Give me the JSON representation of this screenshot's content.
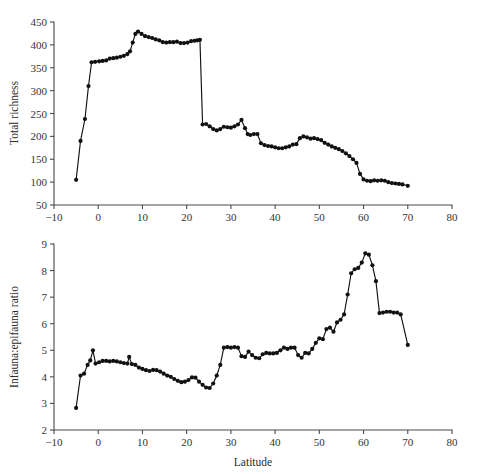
{
  "figure": {
    "background_color": "#ffffff",
    "line_color": "#111111",
    "axis_color": "#4a4a4a",
    "width": 482,
    "height": 474
  },
  "panels": [
    {
      "id": "top-panel",
      "ylabel": "Total richness",
      "xlabel": "",
      "plot": {
        "x": 54,
        "y": 22,
        "w": 398,
        "h": 183
      }
    },
    {
      "id": "bottom-panel",
      "ylabel": "Infauna:epifauna ratio",
      "xlabel": "Latitude",
      "plot": {
        "x": 54,
        "y": 244,
        "w": 398,
        "h": 186
      }
    }
  ],
  "chart_data": [
    {
      "type": "line",
      "title": "",
      "xlabel": "",
      "ylabel": "Total richness",
      "xlim": [
        -10,
        80
      ],
      "ylim": [
        50,
        450
      ],
      "xticks": [
        -10,
        0,
        10,
        20,
        30,
        40,
        50,
        60,
        70,
        80
      ],
      "yticks": [
        50,
        100,
        150,
        200,
        250,
        300,
        350,
        400,
        450
      ],
      "xtick_labels": [
        "−10",
        "0",
        "10",
        "20",
        "30",
        "40",
        "50",
        "60",
        "70",
        "80"
      ],
      "ytick_labels": [
        "50",
        "100",
        "150",
        "200",
        "250",
        "300",
        "350",
        "400",
        "450"
      ],
      "grid": false,
      "legend": null,
      "marker": "filled-circle",
      "x": [
        -5.0,
        -4.0,
        -3.0,
        -2.2,
        -1.5,
        -0.7,
        0.2,
        1.0,
        1.8,
        2.6,
        3.4,
        4.2,
        5.0,
        5.8,
        6.6,
        7.2,
        7.8,
        8.4,
        9.0,
        9.8,
        10.6,
        11.4,
        12.2,
        13.0,
        13.8,
        14.6,
        15.4,
        16.2,
        17.0,
        17.8,
        18.6,
        19.4,
        20.2,
        21.0,
        21.8,
        22.4,
        23.0,
        23.6,
        24.4,
        25.2,
        26.0,
        26.8,
        27.6,
        28.4,
        29.2,
        30.0,
        30.8,
        31.6,
        32.4,
        33.2,
        33.8,
        34.4,
        35.2,
        36.0,
        36.8,
        37.6,
        38.4,
        39.2,
        40.0,
        40.8,
        41.6,
        42.4,
        43.2,
        44.0,
        44.8,
        45.6,
        46.4,
        47.2,
        48.0,
        48.8,
        49.6,
        50.4,
        51.2,
        52.0,
        52.8,
        53.6,
        54.4,
        55.2,
        56.0,
        56.8,
        57.6,
        58.4,
        59.2,
        60.0,
        60.8,
        61.6,
        62.4,
        63.2,
        64.0,
        64.8,
        65.6,
        66.4,
        67.2,
        68.0,
        68.8,
        70.0
      ],
      "values": [
        105,
        190,
        238,
        310,
        362,
        363,
        364,
        365,
        366,
        370,
        371,
        372,
        374,
        376,
        380,
        386,
        405,
        424,
        429,
        424,
        419,
        417,
        415,
        412,
        410,
        406,
        405,
        406,
        406,
        407,
        404,
        404,
        405,
        408,
        409,
        410,
        411,
        226,
        227,
        222,
        216,
        213,
        216,
        221,
        220,
        219,
        222,
        226,
        236,
        218,
        205,
        203,
        205,
        205,
        185,
        181,
        179,
        178,
        176,
        174,
        174,
        176,
        178,
        182,
        183,
        196,
        200,
        198,
        195,
        196,
        194,
        192,
        186,
        182,
        178,
        175,
        172,
        168,
        163,
        157,
        150,
        142,
        118,
        106,
        103,
        102,
        104,
        103,
        104,
        103,
        100,
        98,
        97,
        96,
        95,
        92
      ]
    },
    {
      "type": "line",
      "title": "",
      "xlabel": "Latitude",
      "ylabel": "Infauna:epifauna ratio",
      "xlim": [
        -10,
        80
      ],
      "ylim": [
        2,
        9
      ],
      "xticks": [
        -10,
        0,
        10,
        20,
        30,
        40,
        50,
        60,
        70,
        80
      ],
      "yticks": [
        2,
        3,
        4,
        5,
        6,
        7,
        8,
        9
      ],
      "xtick_labels": [
        "−10",
        "0",
        "10",
        "20",
        "30",
        "40",
        "50",
        "60",
        "70",
        "80"
      ],
      "ytick_labels": [
        "2",
        "3",
        "4",
        "5",
        "6",
        "7",
        "8",
        "9"
      ],
      "grid": false,
      "legend": null,
      "marker": "filled-circle",
      "x": [
        -5.0,
        -4.0,
        -3.2,
        -2.4,
        -1.8,
        -1.2,
        -0.6,
        0.2,
        1.0,
        1.8,
        2.6,
        3.4,
        4.2,
        5.0,
        5.8,
        6.6,
        7.0,
        7.6,
        8.4,
        9.2,
        10.0,
        10.8,
        11.6,
        12.4,
        13.2,
        14.0,
        14.8,
        15.6,
        16.4,
        17.2,
        18.0,
        18.8,
        19.6,
        20.4,
        21.2,
        22.0,
        22.8,
        23.6,
        24.4,
        25.2,
        26.0,
        26.8,
        27.6,
        28.4,
        29.2,
        30.0,
        30.8,
        31.6,
        32.4,
        33.2,
        34.0,
        34.8,
        35.6,
        36.4,
        37.2,
        38.0,
        38.8,
        39.6,
        40.4,
        41.2,
        42.0,
        42.8,
        43.6,
        44.4,
        45.2,
        46.0,
        46.8,
        47.6,
        48.4,
        49.2,
        50.0,
        50.8,
        51.6,
        52.4,
        53.2,
        54.0,
        54.8,
        55.6,
        56.4,
        57.2,
        58.0,
        58.8,
        59.6,
        60.4,
        61.2,
        62.0,
        62.8,
        63.6,
        64.4,
        65.2,
        66.0,
        66.8,
        67.6,
        68.4,
        70.0
      ],
      "values": [
        2.83,
        4.05,
        4.12,
        4.45,
        4.62,
        5.0,
        4.5,
        4.55,
        4.6,
        4.6,
        4.58,
        4.6,
        4.58,
        4.55,
        4.52,
        4.5,
        4.75,
        4.48,
        4.45,
        4.35,
        4.3,
        4.25,
        4.22,
        4.26,
        4.25,
        4.2,
        4.12,
        4.05,
        4.0,
        3.92,
        3.85,
        3.8,
        3.82,
        3.88,
        3.98,
        3.97,
        3.82,
        3.7,
        3.6,
        3.58,
        3.75,
        4.05,
        4.45,
        5.1,
        5.12,
        5.1,
        5.12,
        5.1,
        4.78,
        4.75,
        4.95,
        4.82,
        4.72,
        4.7,
        4.85,
        4.9,
        4.88,
        4.88,
        4.9,
        5.0,
        5.1,
        5.05,
        5.1,
        5.1,
        4.82,
        4.72,
        4.9,
        4.88,
        5.05,
        5.28,
        5.45,
        5.42,
        5.8,
        5.85,
        5.7,
        6.05,
        6.15,
        6.35,
        7.1,
        7.9,
        8.05,
        8.1,
        8.3,
        8.65,
        8.6,
        8.2,
        7.6,
        6.4,
        6.42,
        6.45,
        6.45,
        6.42,
        6.42,
        6.35,
        5.2
      ]
    }
  ]
}
